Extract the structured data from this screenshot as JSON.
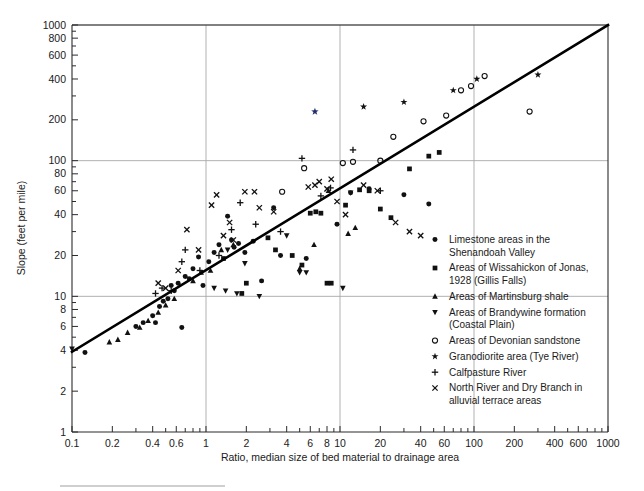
{
  "chart_data": {
    "type": "scatter",
    "title": "",
    "xlabel": "Ratio, median size of bed material to drainage area",
    "ylabel": "Slope (feet per mile)",
    "xscale": "log",
    "yscale": "log",
    "xlim": [
      0.1,
      1000
    ],
    "ylim": [
      1,
      1000
    ],
    "grid": "major-decades",
    "gridlines_x": [
      1,
      10,
      100
    ],
    "gridlines_y": [
      10,
      100,
      1000
    ],
    "xticks": [
      0.1,
      0.2,
      0.4,
      0.6,
      1,
      2,
      4,
      6,
      8,
      10,
      20,
      40,
      60,
      100,
      200,
      400,
      600,
      1000
    ],
    "xticklabels": [
      "0.1",
      "0.2",
      "0.4",
      "0.6",
      "1",
      "2",
      "4",
      "6",
      "8",
      "10",
      "20",
      "40",
      "60",
      "100",
      "200",
      "400",
      "600",
      "1000"
    ],
    "yticks": [
      1,
      2,
      4,
      6,
      8,
      10,
      20,
      40,
      60,
      80,
      100,
      200,
      400,
      600,
      800,
      1000
    ],
    "yticklabels": [
      "1",
      "2",
      "4",
      "6",
      "8",
      "10",
      "20",
      "40",
      "60",
      "80",
      "100",
      "200",
      "400",
      "600",
      "800",
      "1000"
    ],
    "xminor": [
      0.3,
      0.5,
      0.7,
      0.8,
      0.9,
      3,
      5,
      7,
      9,
      30,
      50,
      70,
      80,
      90,
      300,
      500,
      700,
      800,
      900
    ],
    "yminor": [
      3,
      5,
      7,
      9,
      30,
      50,
      70,
      90,
      300,
      500,
      700,
      900
    ],
    "trendline": {
      "label": "regression line",
      "color": "#000000",
      "points": [
        [
          0.1,
          3.9
        ],
        [
          1000,
          1000
        ]
      ]
    },
    "legend_position": "inside-lower-right",
    "series": [
      {
        "name": "Limestone areas in the Shenandoah Valley",
        "marker": "filled-circle",
        "color": "#111111",
        "points": [
          [
            0.125,
            3.85
          ],
          [
            0.3,
            6.0
          ],
          [
            0.34,
            6.4
          ],
          [
            0.4,
            7.2
          ],
          [
            0.42,
            6.4
          ],
          [
            0.45,
            8.4
          ],
          [
            0.48,
            9.2
          ],
          [
            0.52,
            9.6
          ],
          [
            0.55,
            12.0
          ],
          [
            0.58,
            11.0
          ],
          [
            0.62,
            12.5
          ],
          [
            0.66,
            5.9
          ],
          [
            0.7,
            14.0
          ],
          [
            0.75,
            13.5
          ],
          [
            0.8,
            16.0
          ],
          [
            0.88,
            19.5
          ],
          [
            0.95,
            12.0
          ],
          [
            1.05,
            18.0
          ],
          [
            1.15,
            21.0
          ],
          [
            1.25,
            24.0
          ],
          [
            1.45,
            39.0
          ],
          [
            1.55,
            26.0
          ],
          [
            1.62,
            23.0
          ],
          [
            1.75,
            24.5
          ],
          [
            1.95,
            21.0
          ],
          [
            2.25,
            25.5
          ],
          [
            2.6,
            13.0
          ],
          [
            3.2,
            45.0
          ],
          [
            3.6,
            20.0
          ],
          [
            5.6,
            19.0
          ],
          [
            9.5,
            34.0
          ],
          [
            12.0,
            58.0
          ],
          [
            16.5,
            62.0
          ],
          [
            30.0,
            56.0
          ],
          [
            46.0,
            48.0
          ]
        ]
      },
      {
        "name": "Areas of Wissahickon of Jonas, 1928 (Gillis Falls)",
        "marker": "filled-square",
        "color": "#111111",
        "points": [
          [
            1.35,
            19.0
          ],
          [
            1.85,
            10.5
          ],
          [
            2.0,
            12.5
          ],
          [
            2.9,
            27.0
          ],
          [
            3.3,
            22.0
          ],
          [
            4.4,
            20.0
          ],
          [
            5.2,
            17.0
          ],
          [
            6.0,
            41.0
          ],
          [
            6.6,
            42.0
          ],
          [
            7.2,
            41.0
          ],
          [
            8.0,
            12.5
          ],
          [
            8.6,
            12.5
          ],
          [
            11.0,
            47.0
          ],
          [
            14.0,
            61.0
          ],
          [
            16.5,
            60.0
          ],
          [
            20.0,
            44.0
          ],
          [
            24.0,
            38.0
          ],
          [
            33.0,
            87.0
          ],
          [
            46.0,
            108.0
          ],
          [
            55.0,
            115.0
          ]
        ]
      },
      {
        "name": "Areas of Martinsburg shale",
        "marker": "up-triangle",
        "color": "#111111",
        "points": [
          [
            0.19,
            4.6
          ],
          [
            0.22,
            4.8
          ],
          [
            0.26,
            5.4
          ],
          [
            0.32,
            5.9
          ],
          [
            0.37,
            6.6
          ],
          [
            0.44,
            7.6
          ],
          [
            0.5,
            8.6
          ],
          [
            0.58,
            9.6
          ],
          [
            0.8,
            13.0
          ],
          [
            0.92,
            15.0
          ],
          [
            1.08,
            15.5
          ],
          [
            1.3,
            22.0
          ],
          [
            1.6,
            24.0
          ],
          [
            5.0,
            16.0
          ],
          [
            6.4,
            24.0
          ],
          [
            8.2,
            60.0
          ],
          [
            11.5,
            29.0
          ],
          [
            13.0,
            32.0
          ]
        ]
      },
      {
        "name": "Areas of Brandywine formation (Coastal Plain)",
        "marker": "down-triangle",
        "color": "#111111",
        "points": [
          [
            0.1,
            4.1
          ],
          [
            1.15,
            11.5
          ],
          [
            1.4,
            11.0
          ],
          [
            1.45,
            22.0
          ],
          [
            1.7,
            10.5
          ],
          [
            1.95,
            17.5
          ],
          [
            2.5,
            10.0
          ],
          [
            4.0,
            28.0
          ],
          [
            5.0,
            15.0
          ],
          [
            5.6,
            15.0
          ],
          [
            10.5,
            11.5
          ],
          [
            12.0,
            58.0
          ]
        ]
      },
      {
        "name": "Areas of Devonian sandstone",
        "marker": "open-circle",
        "color": "#111111",
        "points": [
          [
            3.7,
            59.0
          ],
          [
            5.4,
            88.0
          ],
          [
            10.5,
            96.0
          ],
          [
            12.5,
            98.0
          ],
          [
            20.0,
            100.0
          ],
          [
            25.0,
            150.0
          ],
          [
            42.0,
            195.0
          ],
          [
            62.0,
            215.0
          ],
          [
            80.0,
            330.0
          ],
          [
            95.0,
            355.0
          ],
          [
            120.0,
            420.0
          ],
          [
            260.0,
            230.0
          ]
        ]
      },
      {
        "name": "Granodiorite area (Tye River)",
        "marker": "star",
        "color": "#111111",
        "points": [
          [
            15.0,
            250.0
          ],
          [
            30.0,
            270.0
          ],
          [
            70.0,
            330.0
          ],
          [
            105.0,
            400.0
          ],
          [
            300.0,
            430.0
          ]
        ],
        "outliers": [
          {
            "point": [
              6.5,
              230.0
            ],
            "color": "#1f2d6e",
            "note": "anomalous dark-blue star"
          }
        ]
      },
      {
        "name": "Calfpasture River",
        "marker": "plus",
        "color": "#111111",
        "points": [
          [
            0.42,
            10.5
          ],
          [
            0.47,
            11.5
          ],
          [
            0.55,
            11.0
          ],
          [
            0.66,
            18.0
          ],
          [
            0.7,
            22.0
          ],
          [
            0.9,
            15.5
          ],
          [
            1.25,
            20.0
          ],
          [
            1.55,
            31.0
          ],
          [
            1.8,
            49.0
          ],
          [
            2.35,
            34.0
          ],
          [
            3.6,
            30.0
          ],
          [
            5.2,
            104.0
          ],
          [
            7.2,
            55.0
          ],
          [
            8.5,
            63.0
          ],
          [
            12.5,
            120.0
          ],
          [
            20.0,
            60.0
          ]
        ]
      },
      {
        "name": "North River and Dry Branch in alluvial terrace areas",
        "marker": "cross",
        "color": "#111111",
        "points": [
          [
            0.44,
            12.5
          ],
          [
            0.5,
            11.5
          ],
          [
            0.62,
            15.5
          ],
          [
            0.72,
            31.0
          ],
          [
            0.88,
            22.0
          ],
          [
            1.1,
            47.0
          ],
          [
            1.2,
            56.0
          ],
          [
            1.35,
            28.0
          ],
          [
            1.5,
            35.0
          ],
          [
            1.6,
            26.0
          ],
          [
            1.95,
            59.0
          ],
          [
            2.3,
            59.0
          ],
          [
            2.5,
            45.0
          ],
          [
            3.2,
            42.0
          ],
          [
            5.8,
            64.0
          ],
          [
            6.5,
            66.0
          ],
          [
            7.0,
            70.0
          ],
          [
            8.0,
            62.0
          ],
          [
            8.6,
            73.0
          ],
          [
            9.5,
            50.0
          ],
          [
            11.0,
            40.0
          ],
          [
            15.0,
            66.0
          ],
          [
            19.0,
            60.0
          ],
          [
            26.0,
            35.0
          ],
          [
            33.0,
            30.0
          ],
          [
            40.0,
            28.0
          ]
        ]
      }
    ]
  },
  "legend": {
    "items": [
      {
        "marker": "filled-circle",
        "lines": [
          "Limestone areas in the",
          "Shenandoah Valley"
        ]
      },
      {
        "marker": "filled-square",
        "lines": [
          "Areas of Wissahickon of Jonas,",
          "1928 (Gillis Falls)"
        ]
      },
      {
        "marker": "up-triangle",
        "lines": [
          "Areas of Martinsburg shale"
        ]
      },
      {
        "marker": "down-triangle",
        "lines": [
          "Areas of Brandywine formation",
          "(Coastal Plain)"
        ]
      },
      {
        "marker": "open-circle",
        "lines": [
          "Areas of Devonian sandstone"
        ]
      },
      {
        "marker": "star",
        "lines": [
          "Granodiorite area (Tye River)"
        ]
      },
      {
        "marker": "plus",
        "lines": [
          "Calfpasture River"
        ]
      },
      {
        "marker": "cross",
        "lines": [
          "North River and Dry Branch in",
          "alluvial terrace areas"
        ]
      }
    ]
  },
  "colors": {
    "axis": "#2b2b2b",
    "grid": "#a8a8a8",
    "marker": "#111111",
    "trend": "#000000",
    "outlier_star": "#1f2d6e",
    "footer_rule": "#cfcfcf"
  }
}
